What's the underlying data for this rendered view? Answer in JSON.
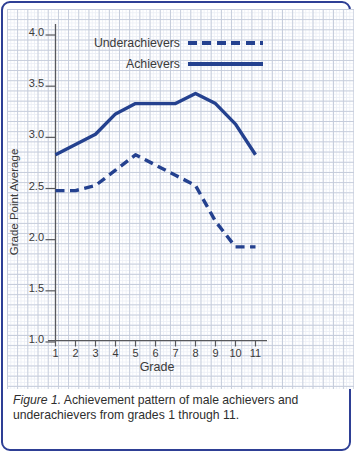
{
  "figure": {
    "caption_label": "Figure 1.",
    "caption_text": " Achievement pattern of male achievers and",
    "caption_line2": "underachievers from grades 1 through 11."
  },
  "colors": {
    "line_blue": "#24418f",
    "card_border": "#2e3f95",
    "grid_major": "#c5ccdb",
    "grid_minor": "#eceff6",
    "axis": "#57585c",
    "tick_text": "#3a3a3a"
  },
  "chart_data": {
    "type": "line",
    "title": "",
    "xlabel": "Grade",
    "ylabel": "Grade Point Average",
    "x": [
      1,
      2,
      3,
      4,
      5,
      6,
      7,
      8,
      9,
      10,
      11
    ],
    "y_ticks": [
      4.0,
      3.5,
      3.0,
      2.5,
      2.0,
      1.5,
      1.0
    ],
    "ylim": [
      1.0,
      4.0
    ],
    "grid": true,
    "legend_position": "top",
    "series": [
      {
        "name": "Underachievers",
        "style": "dashed",
        "values": [
          2.45,
          2.45,
          2.5,
          2.65,
          2.8,
          2.7,
          2.6,
          2.5,
          2.15,
          1.9,
          1.9
        ]
      },
      {
        "name": "Achievers",
        "style": "solid",
        "values": [
          2.8,
          2.9,
          3.0,
          3.2,
          3.3,
          3.3,
          3.3,
          3.4,
          3.3,
          3.1,
          2.8
        ]
      }
    ]
  }
}
